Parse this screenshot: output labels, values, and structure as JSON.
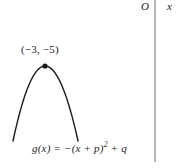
{
  "figure": {
    "type": "math-graph-figure",
    "background_color": "#ffffff",
    "stroke_color": "#1a1a1a"
  },
  "axes": {
    "origin_label": "O",
    "x_axis_label": "x",
    "y_axis_line": {
      "x": 155,
      "y_top": 0,
      "y_bottom": 162
    }
  },
  "annotations": {
    "vertex_label": "(−3, −5)",
    "equation_prefix": "g(x) = −(x + p)",
    "equation_exponent": "2",
    "equation_suffix": " + q",
    "equation_full": "g(x) = −(x + p)² + q"
  },
  "chart_data": {
    "type": "line",
    "title": "",
    "xlabel": "x",
    "ylabel": "",
    "grid": false,
    "legend": null,
    "curve": {
      "name": "g(x) = −(x + p)² + q",
      "shape": "downward-parabola",
      "vertex": {
        "x": -3,
        "y": -5,
        "label": "(−3, −5)"
      },
      "opens": "down",
      "leading_coefficient": -1,
      "pixel_vertex": {
        "x": 45,
        "y": 66
      },
      "pixel_left_end": {
        "x": 13,
        "y": 141
      },
      "pixel_right_end": {
        "x": 78,
        "y": 141
      }
    },
    "points": [
      {
        "label": "(−3, −5)",
        "x": -3,
        "y": -5,
        "marked": true
      }
    ]
  }
}
